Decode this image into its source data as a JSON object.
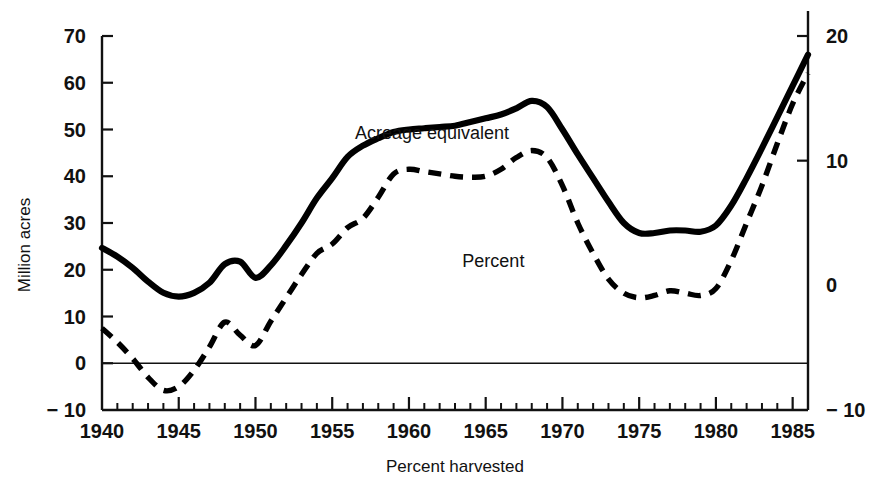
{
  "chart_data": {
    "type": "line",
    "title": "",
    "subtitle": "",
    "xlabel": "Percent harvested",
    "ylabel": "Million acres",
    "ylabel_right": "",
    "xlim": [
      1940,
      1986
    ],
    "ylim": [
      -10,
      70
    ],
    "ylim_right": [
      -10,
      20
    ],
    "grid": false,
    "legend_position": "inline-annotation",
    "y_ticks": [
      -10,
      0,
      10,
      20,
      30,
      40,
      50,
      60,
      70
    ],
    "y_tick_labels": [
      "− 10",
      "0",
      "10",
      "20",
      "30",
      "40",
      "50",
      "60",
      "70"
    ],
    "y_ticks_right": [
      -10,
      0,
      10,
      20
    ],
    "y_tick_labels_right": [
      "− 10",
      "0",
      "10",
      "20"
    ],
    "x_ticks_major": [
      1940,
      1945,
      1950,
      1955,
      1960,
      1965,
      1970,
      1975,
      1980,
      1985
    ],
    "x_tick_labels": [
      "1940",
      "1945",
      "1950",
      "1955",
      "1960",
      "1965",
      "1970",
      "1975",
      "1980",
      "1985"
    ],
    "x_tick_minor_step": 1,
    "x": [
      1940,
      1941,
      1942,
      1943,
      1944,
      1945,
      1946,
      1947,
      1948,
      1949,
      1950,
      1951,
      1952,
      1953,
      1954,
      1955,
      1956,
      1957,
      1958,
      1959,
      1960,
      1961,
      1962,
      1963,
      1964,
      1965,
      1966,
      1967,
      1968,
      1969,
      1970,
      1971,
      1972,
      1973,
      1974,
      1975,
      1976,
      1977,
      1978,
      1979,
      1980,
      1981,
      1982,
      1983,
      1984,
      1985,
      1986
    ],
    "series": [
      {
        "name": "Acreage equivalent",
        "style": "dashed",
        "axis": "left",
        "unit": "Million acres",
        "values": [
          7.5,
          4.5,
          1.0,
          -3.0,
          -5.8,
          -5.0,
          -1.5,
          3.5,
          8.8,
          6.0,
          3.8,
          9.0,
          14.0,
          19.0,
          23.5,
          25.5,
          29.0,
          31.0,
          35.5,
          40.5,
          41.5,
          41.0,
          40.5,
          40.0,
          39.8,
          40.0,
          41.5,
          44.0,
          45.5,
          44.0,
          38.0,
          30.0,
          23.5,
          18.0,
          15.0,
          14.0,
          14.5,
          15.5,
          15.0,
          14.5,
          16.0,
          22.0,
          30.0,
          38.0,
          47.0,
          55.5,
          62.0
        ]
      },
      {
        "name": "Percent",
        "style": "solid",
        "axis": "right",
        "unit": "Percent",
        "values": [
          3.0,
          2.3,
          1.4,
          0.3,
          -0.6,
          -0.9,
          -0.6,
          0.2,
          1.7,
          1.9,
          0.6,
          1.6,
          3.2,
          5.0,
          7.0,
          8.6,
          10.3,
          11.2,
          11.8,
          12.3,
          12.5,
          12.6,
          12.7,
          12.8,
          13.1,
          13.4,
          13.7,
          14.2,
          14.8,
          14.3,
          12.5,
          10.5,
          8.6,
          6.7,
          5.0,
          4.2,
          4.2,
          4.4,
          4.4,
          4.3,
          4.8,
          6.4,
          8.6,
          11.0,
          13.5,
          16.0,
          18.5
        ]
      }
    ],
    "annotations": [
      {
        "text": "Acreage equivalent",
        "x": 1961.5,
        "y": 48.0,
        "series": "Acreage equivalent"
      },
      {
        "text": "Percent",
        "x": 1965.5,
        "y": 20.5,
        "series": "Percent"
      }
    ]
  },
  "colors": {
    "ink": "#111111",
    "series_line": "#000000",
    "background": "#ffffff"
  }
}
